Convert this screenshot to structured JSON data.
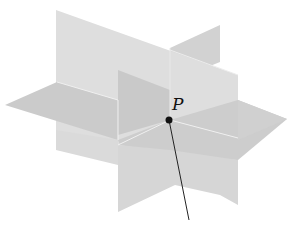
{
  "diagram": {
    "point_label": "P",
    "colors": {
      "background": "#ffffff",
      "plane_light": "#dcdcdc",
      "plane_mid": "#cfcfcf",
      "plane_dark": "#c2c2c2",
      "edge_highlight": "#f2f2f2",
      "point": "#111111",
      "line": "#222222"
    },
    "elements": [
      {
        "name": "vertical-plane-front",
        "type": "plane"
      },
      {
        "name": "vertical-plane-side",
        "type": "plane"
      },
      {
        "name": "horizontal-plane",
        "type": "plane"
      },
      {
        "name": "point-p",
        "type": "point",
        "label": "P"
      },
      {
        "name": "line-through-p",
        "type": "line"
      }
    ]
  }
}
